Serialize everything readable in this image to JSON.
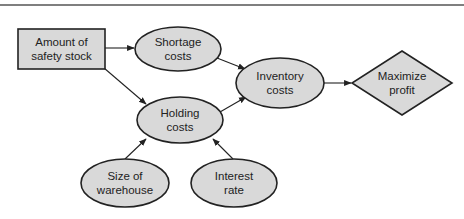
{
  "diagram": {
    "type": "influence-diagram",
    "nodes": [
      {
        "id": "safety_stock",
        "shape": "rectangle",
        "lines": [
          "Amount of",
          "safety stock"
        ],
        "role": "decision"
      },
      {
        "id": "shortage",
        "shape": "ellipse",
        "lines": [
          "Shortage",
          "costs"
        ],
        "role": "chance"
      },
      {
        "id": "holding",
        "shape": "ellipse",
        "lines": [
          "Holding",
          "costs"
        ],
        "role": "chance"
      },
      {
        "id": "inventory",
        "shape": "ellipse",
        "lines": [
          "Inventory",
          "costs"
        ],
        "role": "chance"
      },
      {
        "id": "profit",
        "shape": "diamond",
        "lines": [
          "Maximize",
          "profit"
        ],
        "role": "objective"
      },
      {
        "id": "warehouse",
        "shape": "ellipse",
        "lines": [
          "Size of",
          "warehouse"
        ],
        "role": "chance"
      },
      {
        "id": "interest",
        "shape": "ellipse",
        "lines": [
          "Interest",
          "rate"
        ],
        "role": "chance"
      }
    ],
    "edges": [
      {
        "from": "safety_stock",
        "to": "shortage"
      },
      {
        "from": "safety_stock",
        "to": "holding"
      },
      {
        "from": "shortage",
        "to": "inventory"
      },
      {
        "from": "holding",
        "to": "inventory"
      },
      {
        "from": "inventory",
        "to": "profit"
      },
      {
        "from": "warehouse",
        "to": "holding"
      },
      {
        "from": "interest",
        "to": "holding"
      }
    ],
    "colors": {
      "node_fill": "#d9d9d9",
      "stroke": "#222222",
      "text": "#222222"
    }
  }
}
